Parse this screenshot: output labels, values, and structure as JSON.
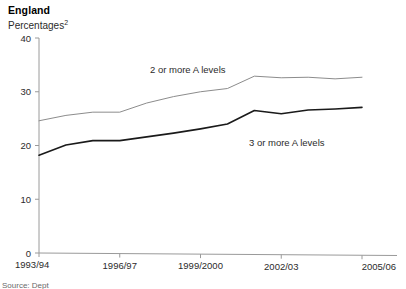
{
  "header": {
    "title": "England",
    "subtitle": "Percentages",
    "subtitle_footnote": "2"
  },
  "footer": {
    "source": "Source: Dept"
  },
  "chart_data": {
    "type": "line",
    "title": "England",
    "subtitle": "Percentages2",
    "xlabel": "",
    "ylabel": "",
    "ylim": [
      0,
      40
    ],
    "yticks": [
      0,
      10,
      20,
      30,
      40
    ],
    "ytick_labels": [
      "0",
      "10",
      "20",
      "30",
      "40"
    ],
    "grid": false,
    "legend": "inline-annotations",
    "x": [
      "1993/94",
      "1994/95",
      "1995/96",
      "1996/97",
      "1997/98",
      "1998/99",
      "1999/2000",
      "2000/01",
      "2001/02",
      "2002/03",
      "2003/04",
      "2004/05",
      "2005/06"
    ],
    "xtick_labels": [
      "1993/94",
      "1996/97",
      "1999/2000",
      "2002/03",
      "2005/06"
    ],
    "xtick_indices": [
      0,
      3,
      6,
      9,
      12
    ],
    "series": [
      {
        "name": "2 or more A levels",
        "color": "#8c8c8c",
        "width": 1.0,
        "values": [
          24.6,
          25.6,
          26.2,
          26.2,
          27.9,
          29.1,
          30.0,
          30.6,
          32.9,
          32.6,
          32.7,
          32.4,
          32.7
        ]
      },
      {
        "name": "3 or more A levels",
        "color": "#1a1a1a",
        "width": 1.6,
        "values": [
          18.2,
          20.1,
          20.9,
          20.9,
          21.6,
          22.3,
          23.1,
          24.0,
          26.5,
          25.9,
          26.6,
          26.8,
          27.1
        ]
      }
    ],
    "annotations": [
      {
        "text": "2 or more A levels",
        "x_px": 150,
        "y_px": 73
      },
      {
        "text": "3 or more A levels",
        "x_px": 249,
        "y_px": 146
      }
    ]
  }
}
